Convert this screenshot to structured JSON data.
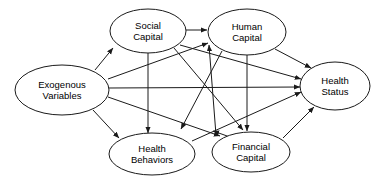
{
  "diagram": {
    "type": "path-diagram",
    "background_color": "#ffffff",
    "line_color": "#1a1a1a",
    "text_color": "#000000",
    "nodes": [
      {
        "id": "exogenous",
        "label": "Exogenous Variables",
        "lines": [
          "Exogenous",
          "Variables"
        ],
        "cx": 62,
        "cy": 90,
        "rx": 47,
        "ry": 25
      },
      {
        "id": "social",
        "label": "Social Capital",
        "lines": [
          "Social",
          "Capital"
        ],
        "cx": 148,
        "cy": 31,
        "rx": 38,
        "ry": 22
      },
      {
        "id": "human",
        "label": "Human Capital",
        "lines": [
          "Human",
          "Capital"
        ],
        "cx": 247,
        "cy": 32,
        "rx": 39,
        "ry": 23
      },
      {
        "id": "health_status",
        "label": "Health Status",
        "lines": [
          "Health",
          "Status"
        ],
        "cx": 335,
        "cy": 86,
        "rx": 35,
        "ry": 24
      },
      {
        "id": "health_behaviors",
        "label": "Health Behaviors",
        "lines": [
          "Health",
          "Behaviors"
        ],
        "cx": 152,
        "cy": 154,
        "rx": 43,
        "ry": 21
      },
      {
        "id": "financial",
        "label": "Financial Capital",
        "lines": [
          "Financial",
          "Capital"
        ],
        "cx": 251,
        "cy": 152,
        "rx": 39,
        "ry": 20
      }
    ],
    "edges": [
      {
        "id": "e1",
        "from": "exogenous",
        "to": "social",
        "x1": 95,
        "y1": 70,
        "x2": 113,
        "y2": 48
      },
      {
        "id": "e2",
        "from": "exogenous",
        "to": "human",
        "x1": 108,
        "y1": 79,
        "x2": 208,
        "y2": 43
      },
      {
        "id": "e3",
        "from": "exogenous",
        "to": "health_status",
        "x1": 109,
        "y1": 88,
        "x2": 300,
        "y2": 87
      },
      {
        "id": "e4",
        "from": "exogenous",
        "to": "financial",
        "x1": 108,
        "y1": 97,
        "x2": 220,
        "y2": 136
      },
      {
        "id": "e5",
        "from": "exogenous",
        "to": "health_behaviors",
        "x1": 93,
        "y1": 110,
        "x2": 119,
        "y2": 138
      },
      {
        "id": "e6",
        "from": "social",
        "to": "human",
        "x1": 186,
        "y1": 30,
        "x2": 207,
        "y2": 30
      },
      {
        "id": "e7",
        "from": "social",
        "to": "health_behaviors",
        "x1": 148,
        "y1": 53,
        "x2": 148,
        "y2": 133
      },
      {
        "id": "e8",
        "from": "social",
        "to": "financial",
        "x1": 174,
        "y1": 48,
        "x2": 243,
        "y2": 130
      },
      {
        "id": "e9",
        "from": "social",
        "to": "health_status",
        "x1": 180,
        "y1": 45,
        "x2": 301,
        "y2": 79
      },
      {
        "id": "e10",
        "from": "human",
        "to": "financial",
        "x1": 247,
        "y1": 55,
        "x2": 247,
        "y2": 131
      },
      {
        "id": "e11",
        "from": "human",
        "to": "health_behaviors",
        "x1": 222,
        "y1": 51,
        "x2": 181,
        "y2": 129
      },
      {
        "id": "e12",
        "from": "human",
        "to": "health_status",
        "x1": 275,
        "y1": 49,
        "x2": 311,
        "y2": 68
      },
      {
        "id": "e13",
        "from": "health_behaviors",
        "to": "health_status",
        "x1": 192,
        "y1": 141,
        "x2": 301,
        "y2": 92
      },
      {
        "id": "e14",
        "from": "financial",
        "to": "human",
        "x1": 216,
        "y1": 135,
        "x2": 209,
        "y2": 45
      },
      {
        "id": "e15",
        "from": "financial",
        "to": "health_behaviors",
        "x1": 230,
        "y1": 137,
        "x2": 213,
        "y2": 131
      },
      {
        "id": "e16",
        "from": "financial",
        "to": "health_status",
        "x1": 283,
        "y1": 138,
        "x2": 314,
        "y2": 107
      }
    ]
  }
}
